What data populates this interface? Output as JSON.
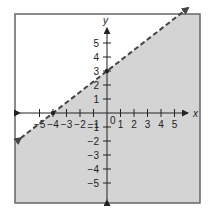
{
  "chart_data": {
    "type": "line",
    "title": "",
    "xlabel": "x",
    "ylabel": "y",
    "xlim": [
      -6,
      6
    ],
    "ylim": [
      -6,
      6
    ],
    "x_ticks": [
      -5,
      -4,
      -3,
      -2,
      -1,
      1,
      2,
      3,
      4,
      5
    ],
    "y_ticks": [
      -5,
      -4,
      -3,
      -2,
      -1,
      1,
      2,
      3,
      4,
      5
    ],
    "origin_label": "0",
    "grid": false,
    "series": [
      {
        "name": "boundary line y = (3/4)x + 3",
        "style": "dashed",
        "slope": 0.75,
        "intercept": 3,
        "points": [
          {
            "x": -4,
            "y": 0
          },
          {
            "x": 0,
            "y": 3
          }
        ],
        "arrows": "both"
      }
    ],
    "shaded_region": "below line (y < (3/4)x + 3)",
    "colors": {
      "shade": "#d4d4d4",
      "line": "#444444",
      "border": "#666666"
    }
  }
}
